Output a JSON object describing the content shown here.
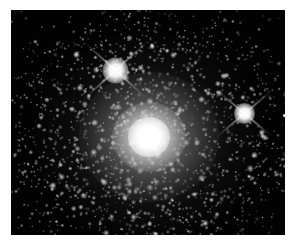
{
  "image": {
    "kind": "astronomical-photograph",
    "subject": "globular star cluster",
    "color_mode": "grayscale",
    "alt_text": "Grayscale astronomical image of a dense globular star cluster with a bright saturated core, surrounded by thousands of resolved stars, with two bright foreground stars showing four-point diffraction spikes.",
    "width": 296,
    "height": 246,
    "border": {
      "color": "#ffffff",
      "left": 11,
      "top": 10,
      "right": 11,
      "bottom": 11
    },
    "sky": {
      "background_color": "#020202",
      "width": 274,
      "height": 225
    }
  },
  "objects": {
    "cluster": {
      "label": "globular cluster",
      "center_x": 138,
      "center_y": 127,
      "core_diameter": 23,
      "halo_diameter": 230,
      "core_color": "#ffffff",
      "halo_color": "#a8a8a8",
      "star_count": 1900
    },
    "bright_stars": [
      {
        "label": "foreground star upper left",
        "center_x": 104,
        "center_y": 60,
        "core_diameter": 26,
        "spike_length": 86,
        "spike_angle_deg": 42,
        "color": "#ffffff"
      },
      {
        "label": "foreground star right",
        "center_x": 233,
        "center_y": 103,
        "core_diameter": 21,
        "spike_length": 74,
        "spike_angle_deg": 40,
        "color": "#ffffff"
      }
    ],
    "edge_star": {
      "label": "faint star at right edge",
      "center_x": 283,
      "center_y": 114,
      "diameter": 3,
      "color": "#f4f4f4"
    }
  },
  "starfield": {
    "seed": 20240617,
    "cluster_star_count": 1500,
    "field_star_count": 260,
    "cluster_center_x": 138,
    "cluster_center_y": 127,
    "cluster_scale_x": 62,
    "cluster_scale_y": 56,
    "min_radius": 0.35,
    "max_radius": 1.5,
    "color": "#ffffff"
  }
}
